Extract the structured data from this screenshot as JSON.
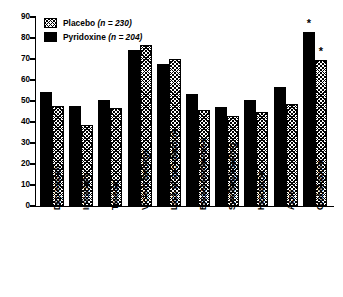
{
  "chart_data": {
    "type": "bar",
    "title": "",
    "xlabel": "",
    "ylabel": "",
    "ylim": [
      0,
      90
    ],
    "ytick_step": 10,
    "yticks": [
      0,
      10,
      20,
      30,
      40,
      50,
      60,
      70,
      80,
      90
    ],
    "grid": false,
    "legend_position": "top-left",
    "categories": [
      "Depression",
      "Irritability",
      "Tension",
      "Violent feelings",
      "Lack of coordination",
      "Breast tenderness",
      "Swelling/bloating",
      "Headache",
      "Acne",
      "Global score"
    ],
    "series": [
      {
        "name": "Pyridoxine",
        "n": 204,
        "legend_label": "Pyridoxine (n = 204)",
        "fill": "solid-black",
        "color": "#000000",
        "values": [
          54.5,
          47.5,
          50.5,
          74.5,
          67.5,
          53.5,
          47.0,
          50.5,
          56.5,
          83.0
        ]
      },
      {
        "name": "Placebo",
        "n": 230,
        "legend_label": "Placebo (n = 230)",
        "fill": "cross-hatch",
        "color": "#000000",
        "values": [
          47.5,
          38.5,
          46.5,
          76.5,
          70.0,
          45.5,
          43.0,
          45.0,
          48.5,
          69.5
        ]
      }
    ],
    "annotations": [
      {
        "text": "*",
        "category": "Global score",
        "series": "Pyridoxine"
      },
      {
        "text": "*",
        "category": "Global score",
        "series": "Placebo"
      }
    ]
  },
  "legend": {
    "items": [
      {
        "label_main": "Placebo",
        "label_n": "(n = 230)",
        "fill": "cross-hatch"
      },
      {
        "label_main": "Pyridoxine",
        "label_n": "(n = 204)",
        "fill": "solid-black"
      }
    ]
  }
}
